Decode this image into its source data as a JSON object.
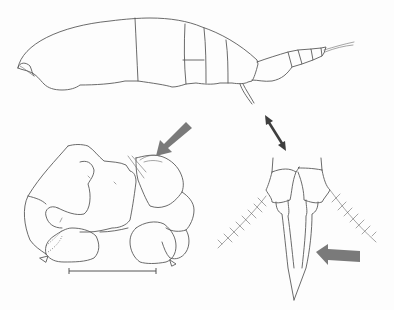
{
  "figure": {
    "kind": "scientific line illustration",
    "panels": [
      {
        "id": "habitus",
        "description": "lateral view of whole animal, segmented body with antenna at right"
      },
      {
        "id": "appendage",
        "description": "folded appendage / mouthpart detail with setae"
      },
      {
        "id": "uropods",
        "description": "paired uropods with plumose setae and elongate telson/rami"
      }
    ],
    "annotations": {
      "arrows": [
        {
          "id": "arrow-appendage",
          "style": "grey-block",
          "color": "#7a7a7a",
          "points_to": "appendage setae"
        },
        {
          "id": "arrow-uropod",
          "style": "grey-block",
          "color": "#7a7a7a",
          "points_to": "uropod ramus spine"
        },
        {
          "id": "arrow-double",
          "style": "dark-double-headed",
          "color": "#3e3e3e",
          "relates": "habitus tail to uropod panel"
        }
      ],
      "scale_bar": {
        "label": ""
      }
    },
    "colors": {
      "background": "#fdfdfd",
      "line": "#5a5a5a",
      "arrow_grey": "#7a7a7a",
      "arrow_dark": "#3e3e3e"
    }
  }
}
